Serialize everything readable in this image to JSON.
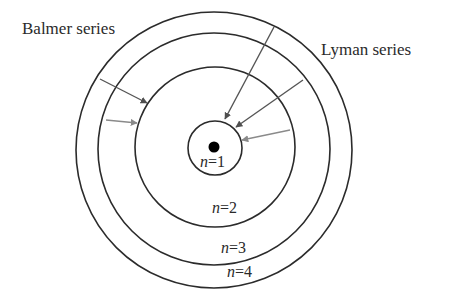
{
  "diagram": {
    "type": "bohr-model-hydrogen-spectral-series",
    "colors": {
      "orbit": "#2b2b2b",
      "nucleus": "#000000",
      "arrow_dark": "#555555",
      "arrow_light": "#8a8a8a",
      "text": "#2a2a2a",
      "background": "#ffffff"
    },
    "series_labels": {
      "balmer": "Balmer series",
      "lyman": "Lyman series"
    },
    "orbits": [
      {
        "n": 1,
        "var": "n",
        "eq": "=1",
        "label": "n=1",
        "radius": 27
      },
      {
        "n": 2,
        "var": "n",
        "eq": "=2",
        "label": "n=2",
        "radius": 80
      },
      {
        "n": 3,
        "var": "n",
        "eq": "=3",
        "label": "n=3",
        "radius": 117
      },
      {
        "n": 4,
        "var": "n",
        "eq": "=4",
        "label": "n=4",
        "radius": 138
      }
    ],
    "transitions": [
      {
        "series": "Balmer",
        "from": 4,
        "to": 2
      },
      {
        "series": "Balmer",
        "from": 3,
        "to": 2
      },
      {
        "series": "Lyman",
        "from": 4,
        "to": 1
      },
      {
        "series": "Lyman",
        "from": 3,
        "to": 1
      },
      {
        "series": "Lyman",
        "from": 2,
        "to": 1
      }
    ]
  }
}
